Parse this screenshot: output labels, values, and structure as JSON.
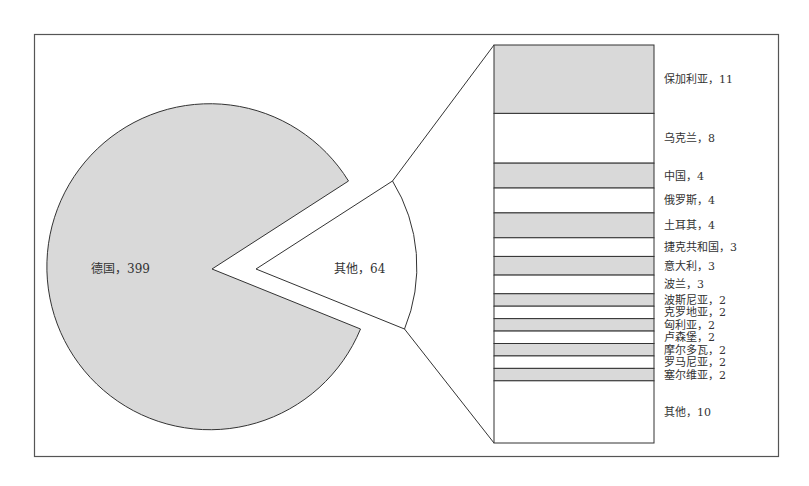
{
  "chart_data": {
    "type": "pie",
    "subtype": "bar-of-pie",
    "title": "",
    "main_pie": {
      "slices": [
        {
          "label": "德国",
          "value": 399,
          "display": "德国，399",
          "fill": "#d9d9d9"
        },
        {
          "label": "其他",
          "value": 64,
          "display": "其他，64",
          "fill": "#ffffff",
          "exploded_to_bar": true
        }
      ]
    },
    "bar_breakdown": {
      "total": 64,
      "segments": [
        {
          "label": "保加利亚",
          "value": 11,
          "display": "保加利亚，11",
          "fill": "#d9d9d9"
        },
        {
          "label": "乌克兰",
          "value": 8,
          "display": "乌克兰，8",
          "fill": "#ffffff"
        },
        {
          "label": "中国",
          "value": 4,
          "display": "中国，4",
          "fill": "#d9d9d9"
        },
        {
          "label": "俄罗斯",
          "value": 4,
          "display": "俄罗斯，4",
          "fill": "#ffffff"
        },
        {
          "label": "土耳其",
          "value": 4,
          "display": "土耳其，4",
          "fill": "#d9d9d9"
        },
        {
          "label": "捷克共和国",
          "value": 3,
          "display": "捷克共和国，3",
          "fill": "#ffffff"
        },
        {
          "label": "意大利",
          "value": 3,
          "display": "意大利，3",
          "fill": "#d9d9d9"
        },
        {
          "label": "波兰",
          "value": 3,
          "display": "波兰，3",
          "fill": "#ffffff"
        },
        {
          "label": "波斯尼亚",
          "value": 2,
          "display": "波斯尼亚，2",
          "fill": "#d9d9d9"
        },
        {
          "label": "克罗地亚",
          "value": 2,
          "display": "克罗地亚，2",
          "fill": "#ffffff"
        },
        {
          "label": "匈利亚",
          "value": 2,
          "display": "匈利亚，2",
          "fill": "#d9d9d9"
        },
        {
          "label": "卢森堡",
          "value": 2,
          "display": "卢森堡，2",
          "fill": "#ffffff"
        },
        {
          "label": "摩尔多瓦",
          "value": 2,
          "display": "摩尔多瓦，2",
          "fill": "#d9d9d9"
        },
        {
          "label": "罗马尼亚",
          "value": 2,
          "display": "罗马尼亚，2",
          "fill": "#ffffff"
        },
        {
          "label": "塞尔维亚",
          "value": 2,
          "display": "塞尔维亚，2",
          "fill": "#d9d9d9"
        },
        {
          "label": "其他",
          "value": 10,
          "display": "其他，10",
          "fill": "#ffffff"
        }
      ]
    },
    "legend": "none",
    "grid": false
  },
  "colors": {
    "shaded": "#d9d9d9",
    "unshaded": "#ffffff",
    "stroke": "#333333",
    "frame": "#555555"
  }
}
